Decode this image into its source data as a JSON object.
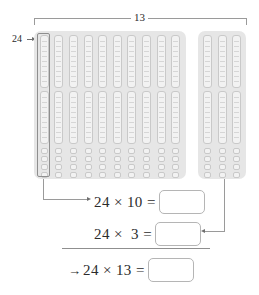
{
  "diagram": {
    "type": "base-ten-blocks-area-model",
    "top_bracket_label": "13",
    "left_label": "24",
    "left_block": {
      "columns": 10,
      "rods_per_column": 2,
      "units_per_rod": 10,
      "loose_units_per_column": 4,
      "column_total": 24
    },
    "right_block": {
      "columns": 3,
      "rods_per_column": 2,
      "units_per_rod": 10,
      "loose_units_per_column": 4,
      "column_total": 24
    }
  },
  "equations": [
    {
      "lead": "",
      "expr": "24 × 10 =",
      "answer": ""
    },
    {
      "lead": "",
      "expr": "24 ×  3 =",
      "answer": ""
    },
    {
      "lead": "→",
      "expr": "24 × 13 =",
      "answer": ""
    }
  ],
  "colors": {
    "panel": "#e6e6e6",
    "block_fill": "#f2f2f2",
    "block_stroke": "#c9c9c9",
    "line": "#9a9a9a",
    "text": "#2b2b2b"
  }
}
